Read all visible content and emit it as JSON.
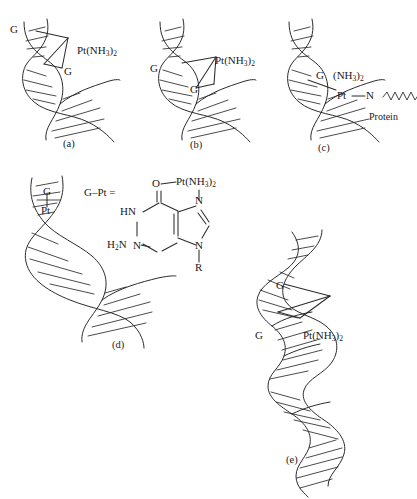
{
  "figure": {
    "line_color": "#2b2b2b",
    "background": "#ffffff"
  },
  "panels": [
    {
      "id": "a",
      "caption": "(a)",
      "binding_mode": "1,2-intrastrand crosslink between two adjacent guanines",
      "labels": [
        {
          "name": "g-label-upper",
          "text": "G"
        },
        {
          "name": "g-label-lower",
          "text": "G"
        },
        {
          "name": "platinum-label",
          "text": "Pt(NH3)2",
          "html": "Pt(NH<sub>3</sub>)<sub>2</sub>"
        }
      ]
    },
    {
      "id": "b",
      "caption": "(b)",
      "binding_mode": "1,3-intrastrand crosslink between two guanines separated by a base",
      "labels": [
        {
          "name": "g-label-upper",
          "text": "G"
        },
        {
          "name": "g-label-lower",
          "text": "G"
        },
        {
          "name": "platinum-label",
          "text": "Pt(NH3)2",
          "html": "Pt(NH<sub>3</sub>)<sub>2</sub>"
        }
      ]
    },
    {
      "id": "c",
      "caption": "(c)",
      "binding_mode": "DNA-protein crosslink through guanine and a protein nitrogen",
      "labels": [
        {
          "name": "g-label",
          "text": "G"
        },
        {
          "name": "ammine-label",
          "text": "(NH3)2",
          "html": "(NH<sub>3</sub>)<sub>2</sub>"
        },
        {
          "name": "platinum-label",
          "text": "Pt"
        },
        {
          "name": "nitrogen-label",
          "text": "N"
        },
        {
          "name": "protein-label",
          "text": "Protein"
        }
      ]
    },
    {
      "id": "d",
      "caption": "(d)",
      "binding_mode": "Monofunctional guanine adduct",
      "labels": [
        {
          "name": "g-label",
          "text": "G"
        },
        {
          "name": "platinum-label",
          "text": "Pt"
        }
      ]
    },
    {
      "id": "e",
      "caption": "(e)",
      "binding_mode": "Interstrand crosslink between guanines on opposite strands",
      "labels": [
        {
          "name": "g-label-upper",
          "text": "G"
        },
        {
          "name": "g-label-lower",
          "text": "G"
        },
        {
          "name": "platinum-label",
          "text": "Pt(NH3)2",
          "html": "Pt(NH<sub>3</sub>)<sub>2</sub>"
        }
      ]
    }
  ],
  "inset": {
    "name": "guanine-platinum-structure",
    "definition_label": "G–Pt =",
    "atoms": [
      {
        "name": "carbonyl-oxygen",
        "text": "O"
      },
      {
        "name": "platinum-ammine",
        "text": "Pt(NH3)2",
        "html": "Pt(NH<sub>3</sub>)<sub>2</sub>"
      },
      {
        "name": "ring-nh",
        "text": "HN"
      },
      {
        "name": "amino-group",
        "text": "H2N",
        "html": "H<sub>2</sub>N"
      },
      {
        "name": "n3-nitrogen",
        "text": "N"
      },
      {
        "name": "n7-nitrogen",
        "text": "N"
      },
      {
        "name": "n9-nitrogen",
        "text": "N"
      },
      {
        "name": "sugar-substituent",
        "text": "R"
      }
    ]
  }
}
